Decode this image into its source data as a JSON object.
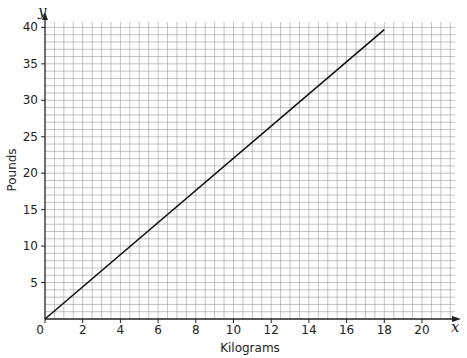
{
  "chart_data": {
    "type": "line",
    "title": "",
    "xlabel": "Kilograms",
    "ylabel": "Pounds",
    "x_axis_var": "x",
    "y_axis_var": "y",
    "xlim": [
      0,
      21.5
    ],
    "ylim": [
      0,
      41
    ],
    "x_ticks": [
      0,
      2,
      4,
      6,
      8,
      10,
      12,
      14,
      16,
      18,
      20
    ],
    "y_ticks": [
      5,
      10,
      15,
      20,
      25,
      30,
      35,
      40
    ],
    "grid": true,
    "series": [
      {
        "name": "Kilograms to Pounds",
        "x": [
          0,
          18
        ],
        "y": [
          0,
          39.7
        ],
        "color": "#111111"
      }
    ]
  }
}
